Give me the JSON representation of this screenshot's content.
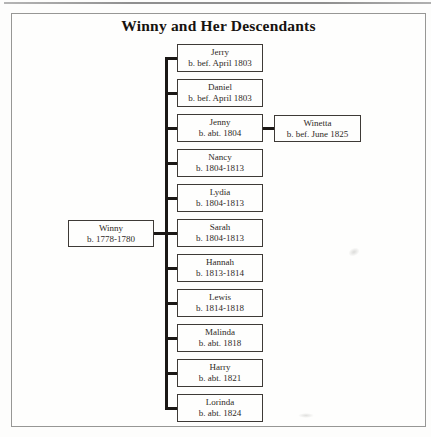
{
  "title": "Winny and Her Descendants",
  "tree": {
    "root": {
      "name": "Winny",
      "dates": "b. 1778-1780"
    },
    "children": [
      {
        "name": "Jerry",
        "dates": "b. bef. April 1803"
      },
      {
        "name": "Daniel",
        "dates": "b. bef. April 1803"
      },
      {
        "name": "Jenny",
        "dates": "b. abt. 1804"
      },
      {
        "name": "Nancy",
        "dates": "b. 1804-1813"
      },
      {
        "name": "Lydia",
        "dates": "b. 1804-1813"
      },
      {
        "name": "Sarah",
        "dates": "b. 1804-1813"
      },
      {
        "name": "Hannah",
        "dates": "b. 1813-1814"
      },
      {
        "name": "Lewis",
        "dates": "b. 1814-1818"
      },
      {
        "name": "Malinda",
        "dates": "b. abt. 1818"
      },
      {
        "name": "Harry",
        "dates": "b. abt. 1821"
      },
      {
        "name": "Lorinda",
        "dates": "b. abt. 1824"
      }
    ],
    "grandchild": {
      "name": "Winetta",
      "dates": "b. bef. June 1825",
      "linked_to": "Jenny"
    }
  },
  "colors": {
    "ink": "#2e2a26",
    "connector_line": "#1a1715",
    "box_border": "#3e3a36",
    "frame_border": "#979795",
    "background": "#fdfdfc"
  }
}
